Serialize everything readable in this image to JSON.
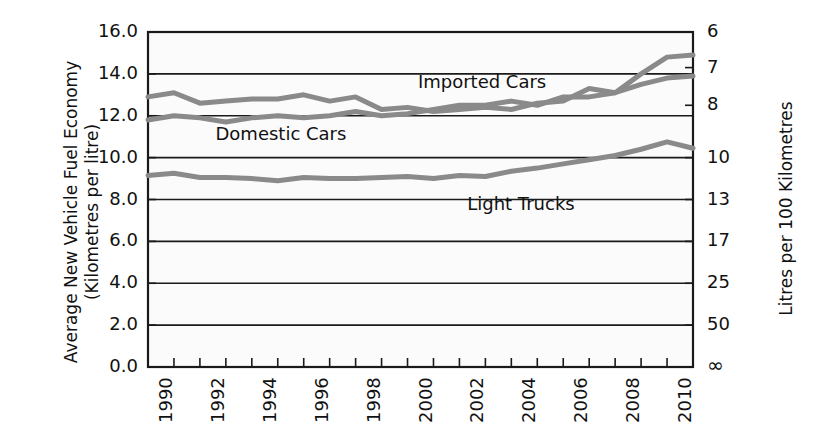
{
  "chart_data": {
    "type": "line",
    "title": "",
    "ylabel_left_line1": "Average New Vehicle Fuel Economy",
    "ylabel_left_line2": "(Kilometres per litre)",
    "ylabel_right": "Litres per 100 Kilometres",
    "xlabel": "",
    "grid": true,
    "legend_position": "inline-annotations",
    "ylim": [
      0.0,
      16.0
    ],
    "yticks_left": [
      "0.0",
      "2.0",
      "4.0",
      "6.0",
      "8.0",
      "10.0",
      "12.0",
      "14.0",
      "16.0"
    ],
    "yticks_left_values": [
      0.0,
      2.0,
      4.0,
      6.0,
      8.0,
      10.0,
      12.0,
      14.0,
      16.0
    ],
    "yticks_right": [
      "∞",
      "50",
      "25",
      "17",
      "13",
      "10",
      "8",
      "7",
      "6"
    ],
    "yticks_right_values": [
      0.0,
      2.0,
      4.0,
      6.0,
      8.0,
      10.0,
      12.5,
      14.3,
      16.0
    ],
    "xlim": [
      1990,
      2011
    ],
    "x": [
      1990,
      1991,
      1992,
      1993,
      1994,
      1995,
      1996,
      1997,
      1998,
      1999,
      2000,
      2001,
      2002,
      2003,
      2004,
      2005,
      2006,
      2007,
      2008,
      2009,
      2010,
      2011
    ],
    "xticks": [
      "1990",
      "1992",
      "1994",
      "1996",
      "1998",
      "2000",
      "2002",
      "2004",
      "2006",
      "2008",
      "2010"
    ],
    "xticks_values": [
      1990,
      1992,
      1994,
      1996,
      1998,
      2000,
      2002,
      2004,
      2006,
      2008,
      2010
    ],
    "series": [
      {
        "name": "Imported Cars",
        "color": "#8a8a8a",
        "label_x": 2000.4,
        "label_y": 13.55,
        "values": [
          12.9,
          13.1,
          12.6,
          12.7,
          12.8,
          12.8,
          13.0,
          12.7,
          12.9,
          12.3,
          12.4,
          12.2,
          12.3,
          12.4,
          12.3,
          12.6,
          12.7,
          13.3,
          13.1,
          14.0,
          14.8,
          14.9
        ]
      },
      {
        "name": "Domestic Cars",
        "color": "#8a8a8a",
        "label_x": 1992.6,
        "label_y": 11.1,
        "values": [
          11.8,
          12.0,
          11.9,
          11.7,
          11.9,
          12.0,
          11.9,
          12.0,
          12.2,
          12.0,
          12.1,
          12.3,
          12.5,
          12.5,
          12.7,
          12.5,
          12.9,
          12.9,
          13.1,
          13.5,
          13.8,
          13.9
        ]
      },
      {
        "name": "Light Trucks",
        "color": "#8a8a8a",
        "label_x": 2002.3,
        "label_y": 7.75,
        "values": [
          9.15,
          9.25,
          9.05,
          9.05,
          9.0,
          8.9,
          9.05,
          9.0,
          9.0,
          9.05,
          9.1,
          9.0,
          9.15,
          9.1,
          9.35,
          9.5,
          9.7,
          9.9,
          10.1,
          10.4,
          10.75,
          10.45
        ]
      }
    ],
    "axis_color": "#1a1a1a",
    "grid_color": "#1a1a1a",
    "plot_background": "#fbfbfb"
  }
}
